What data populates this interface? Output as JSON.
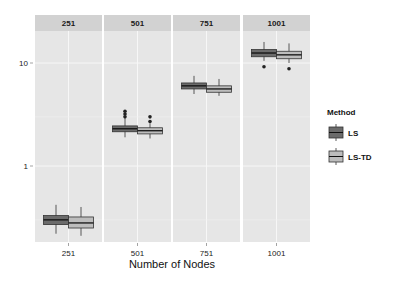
{
  "chart_data": {
    "type": "boxplot",
    "title": "",
    "xlabel": "Number of Nodes",
    "ylabel": "",
    "y_scale": "log10",
    "y_ticks": [
      1,
      10
    ],
    "y_tick_labels": [
      "1",
      "10"
    ],
    "ylim": [
      0.18,
      30
    ],
    "facets": [
      "251",
      "501",
      "751",
      "1001"
    ],
    "x_tick_labels": [
      "251",
      "501",
      "751",
      "1001"
    ],
    "legend": {
      "title": "Method",
      "position": "right",
      "entries": [
        {
          "label": "LS",
          "color": "#6b6b6b"
        },
        {
          "label": "LS-TD",
          "color": "#bdbdbd"
        }
      ]
    },
    "grid": true,
    "series": [
      {
        "name": "LS",
        "boxes": [
          {
            "facet": "251",
            "whisker_low": 0.22,
            "q1": 0.27,
            "median": 0.3,
            "q3": 0.33,
            "whisker_high": 0.42,
            "outliers": []
          },
          {
            "facet": "501",
            "whisker_low": 1.9,
            "q1": 2.15,
            "median": 2.3,
            "q3": 2.45,
            "whisker_high": 2.9,
            "outliers": [
              3.0,
              3.2,
              3.4
            ]
          },
          {
            "facet": "751",
            "whisker_low": 5.0,
            "q1": 5.6,
            "median": 6.0,
            "q3": 6.4,
            "whisker_high": 7.5,
            "outliers": []
          },
          {
            "facet": "1001",
            "whisker_low": 10.5,
            "q1": 11.5,
            "median": 12.5,
            "q3": 13.5,
            "whisker_high": 16.0,
            "outliers": [
              9.2
            ]
          }
        ]
      },
      {
        "name": "LS-TD",
        "boxes": [
          {
            "facet": "251",
            "whisker_low": 0.21,
            "q1": 0.25,
            "median": 0.28,
            "q3": 0.32,
            "whisker_high": 0.4,
            "outliers": []
          },
          {
            "facet": "501",
            "whisker_low": 1.85,
            "q1": 2.05,
            "median": 2.2,
            "q3": 2.35,
            "whisker_high": 2.6,
            "outliers": [
              2.7,
              3.0
            ]
          },
          {
            "facet": "751",
            "whisker_low": 4.8,
            "q1": 5.2,
            "median": 5.6,
            "q3": 6.0,
            "whisker_high": 7.0,
            "outliers": []
          },
          {
            "facet": "1001",
            "whisker_low": 10.0,
            "q1": 11.0,
            "median": 12.0,
            "q3": 13.0,
            "whisker_high": 15.5,
            "outliers": [
              8.8
            ]
          }
        ]
      }
    ]
  },
  "colors": {
    "panel_bg": "#e6e6e6",
    "strip_bg": "#d2d2d2",
    "grid": "#f7f7f7",
    "ls_fill": "#6b6b6b",
    "lstd_fill": "#bdbdbd",
    "line": "#333333"
  }
}
